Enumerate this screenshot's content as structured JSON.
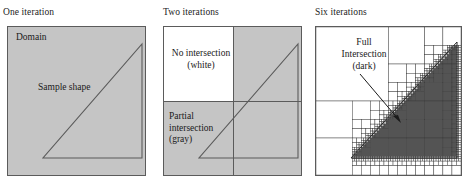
{
  "figure": {
    "background": "#ffffff",
    "gray_fill": "#c5c5c5",
    "dark_fill": "#545454",
    "white_fill": "#ffffff",
    "line_color": "#5b5b5b",
    "text_color": "#1a1a1a"
  },
  "panels": [
    {
      "id": "one-iteration",
      "title": "One iteration",
      "labels": {
        "domain": "Domain",
        "sample_shape": "Sample shape"
      }
    },
    {
      "id": "two-iterations",
      "title": "Two iterations",
      "labels": {
        "no_intersection_line1": "No intersection",
        "no_intersection_line2": "(white)",
        "partial_line1": "Partial",
        "partial_line2": "intersection",
        "partial_line3": "(gray)"
      }
    },
    {
      "id": "six-iterations",
      "title": "Six iterations",
      "labels": {
        "full_line1": "Full",
        "full_line2": "Intersection",
        "full_line3": "(dark)"
      }
    }
  ],
  "chart_data": {
    "type": "diagram",
    "panel_count": 3,
    "iteration_labels": [
      "One iteration",
      "Two iterations",
      "Six iterations"
    ],
    "cell_classification": [
      {
        "name": "No intersection",
        "color": "#ffffff",
        "legend": "(white)"
      },
      {
        "name": "Partial intersection",
        "color": "#c5c5c5",
        "legend": "(gray)"
      },
      {
        "name": "Full Intersection",
        "color": "#545454",
        "legend": "(dark)"
      }
    ],
    "shape": {
      "type": "triangle",
      "vertices_normalized": [
        [
          0.25,
          0.88
        ],
        [
          0.98,
          0.88
        ],
        [
          0.98,
          0.12
        ]
      ]
    },
    "panel_detail": [
      {
        "iterations": 1,
        "grid": "1x1",
        "cells": 1
      },
      {
        "iterations": 2,
        "grid": "2x2",
        "cells": 4,
        "white_cells": 1,
        "gray_cells": 3
      },
      {
        "iterations": 6,
        "grid": "adaptive quadtree",
        "max_depth": 6
      }
    ]
  }
}
